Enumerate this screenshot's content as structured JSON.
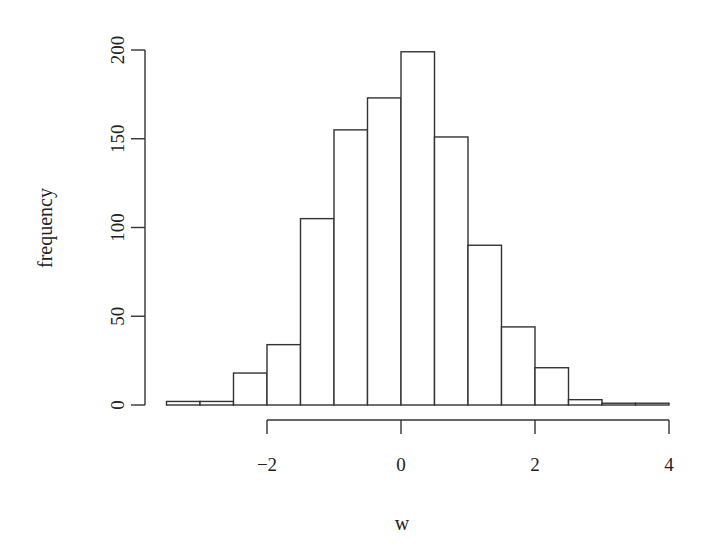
{
  "chart_data": {
    "type": "bar",
    "subtype": "histogram",
    "title": "",
    "xlabel": "w",
    "ylabel": "frequency",
    "bin_edges": [
      -3.5,
      -3.0,
      -2.5,
      -2.0,
      -1.5,
      -1.0,
      -0.5,
      0.0,
      0.5,
      1.0,
      1.5,
      2.0,
      2.5,
      3.0,
      3.5,
      4.0
    ],
    "categories": [
      "-3.5 to -3.0",
      "-3.0 to -2.5",
      "-2.5 to -2.0",
      "-2.0 to -1.5",
      "-1.5 to -1.0",
      "-1.0 to -0.5",
      "-0.5 to 0.0",
      "0.0 to 0.5",
      "0.5 to 1.0",
      "1.0 to 1.5",
      "1.5 to 2.0",
      "2.0 to 2.5",
      "2.5 to 3.0",
      "3.0 to 3.5",
      "3.5 to 4.0"
    ],
    "values": [
      2,
      2,
      18,
      34,
      105,
      155,
      173,
      199,
      151,
      90,
      44,
      21,
      3,
      1,
      1
    ],
    "xlim": [
      -3.5,
      4
    ],
    "ylim": [
      0,
      200
    ],
    "x_ticks": [
      -2,
      0,
      2,
      4
    ],
    "x_tick_labels": [
      "−2",
      "0",
      "2",
      "4"
    ],
    "y_ticks": [
      0,
      50,
      100,
      150,
      200
    ],
    "y_tick_labels": [
      "0",
      "50",
      "100",
      "150",
      "200"
    ],
    "grid": false,
    "legend": null,
    "bar_fill": "#ffffff",
    "bar_stroke": "#333333"
  }
}
